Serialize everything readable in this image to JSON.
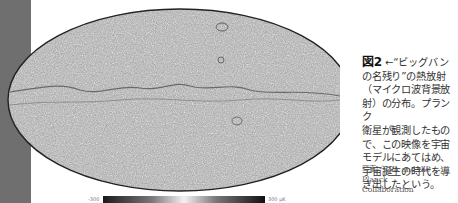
{
  "figure": {
    "label": "図2",
    "arrow": "←",
    "caption_lines": [
      "“ビッグバン",
      "の名残り”の熱放射",
      "（マイクロ波背景放",
      "射）の分布。プランク",
      "衛星が観測したもの",
      "で、この映像を宇宙",
      "モデルにあてはめ、",
      "宇宙誕生の時代を導",
      "き出したという。"
    ],
    "credit_lines": [
      "写真／ESA and the  Planck",
      "Collaboration"
    ]
  },
  "colorbar": {
    "min_label": "-300",
    "max_label": "300 μK"
  },
  "image": {
    "description": "Planck CMB all-sky map (Mollweide projection, grayscale)"
  }
}
